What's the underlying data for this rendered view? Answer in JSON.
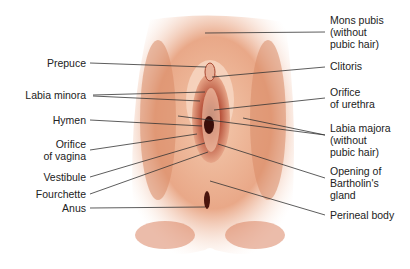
{
  "diagram": {
    "type": "anatomical-illustration",
    "colors": {
      "skin_light": "#f6d9c4",
      "skin_mid": "#e8a27e",
      "skin_dark": "#c8603d",
      "inner": "#8a2b1e",
      "line": "#333333"
    },
    "labels_left": [
      {
        "id": "prepuce",
        "text": "Prepuce"
      },
      {
        "id": "labia-minora",
        "text": "Labia minora"
      },
      {
        "id": "hymen",
        "text": "Hymen"
      },
      {
        "id": "orifice-vagina",
        "text": "Orifice\nof vagina"
      },
      {
        "id": "vestibule",
        "text": "Vestibule"
      },
      {
        "id": "fourchette",
        "text": "Fourchette"
      },
      {
        "id": "anus",
        "text": "Anus"
      }
    ],
    "labels_right": [
      {
        "id": "mons-pubis",
        "text": "Mons pubis\n(without\npubic hair)"
      },
      {
        "id": "clitoris",
        "text": "Clitoris"
      },
      {
        "id": "orifice-urethra",
        "text": "Orifice\nof urethra"
      },
      {
        "id": "labia-majora",
        "text": "Labia majora\n(without\npubic hair)"
      },
      {
        "id": "bartholin",
        "text": "Opening of\nBartholin's\ngland"
      },
      {
        "id": "perineal-body",
        "text": "Perineal body"
      }
    ]
  }
}
